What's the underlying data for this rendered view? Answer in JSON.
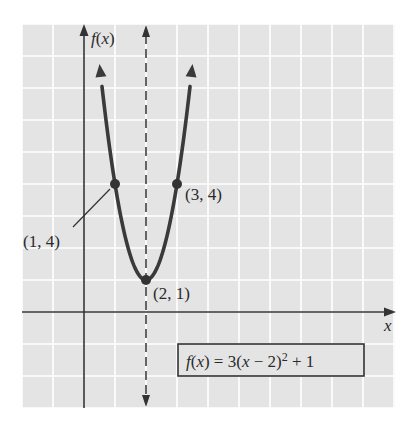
{
  "chart_data": {
    "type": "line",
    "title": "",
    "function": "f(x) = 3(x - 2)^2 + 1",
    "xlabel": "x",
    "ylabel": "f(x)",
    "xlim": [
      -2,
      10
    ],
    "ylim": [
      -3,
      9
    ],
    "grid": true,
    "legend": null,
    "series": [
      {
        "name": "f(x) = 3(x - 2)^2 + 1",
        "x": [
          0.5,
          1,
          1.5,
          2,
          2.5,
          3,
          3.5
        ],
        "y": [
          7.75,
          4,
          1.75,
          1,
          1.75,
          4,
          7.75
        ]
      }
    ],
    "axis_of_symmetry": {
      "x": 2,
      "style": "dashed"
    },
    "points": [
      {
        "label": "(1, 4)",
        "x": 1,
        "y": 4
      },
      {
        "label": "(3, 4)",
        "x": 3,
        "y": 4
      },
      {
        "label": "(2, 1)",
        "x": 2,
        "y": 1,
        "role": "vertex"
      }
    ],
    "annotations": [
      "f(x) = 3(x − 2)² + 1"
    ]
  },
  "labels": {
    "y_axis_f": "f",
    "y_axis_open": "(",
    "y_axis_x": "x",
    "y_axis_close": ")",
    "x_axis": "x",
    "point_left": "(1, 4)",
    "point_right": "(3, 4)",
    "vertex": "(2, 1)",
    "formula_f": "f",
    "formula_open": "(",
    "formula_x": "x",
    "formula_mid": ") = 3(",
    "formula_x2": "x",
    "formula_minus": " − 2)",
    "formula_exp": "2",
    "formula_tail": " + 1"
  },
  "colors": {
    "grid_fill": "#e4e4e4",
    "grid_line": "#ffffff",
    "curve": "#3a3a3a",
    "axis": "#333333",
    "background": "#ffffff"
  }
}
